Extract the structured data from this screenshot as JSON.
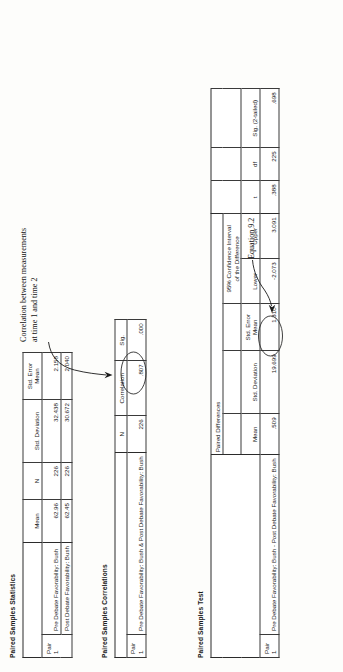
{
  "page": {
    "orientation": "rotated-90-ccw",
    "background": "#fdfdfb",
    "ink": "#1a1a1a"
  },
  "annotations": [
    {
      "id": "corr-note",
      "line1": "Correlation between measurements",
      "line2": "at time 1 and time 2",
      "points_to": ".807"
    },
    {
      "id": "equation-note",
      "text": "Equation 9.2",
      "points_to": "1.310"
    }
  ],
  "tables": [
    {
      "id": "paired-samples-statistics",
      "title": "Paired Samples Statistics",
      "columns": [
        "",
        "",
        "Mean",
        "N",
        "Std. Deviation",
        "Std. Error Mean"
      ],
      "pair_label": "Pair",
      "pair_number": "1",
      "rows": [
        {
          "label": "Pre Debate Favorability: Bush",
          "mean": "62.96",
          "n": "226",
          "std_deviation": "32.438",
          "std_error_mean": "2.158"
        },
        {
          "label": "Post Debate Favorability: Bush",
          "mean": "62.45",
          "n": "226",
          "std_deviation": "30.672",
          "std_error_mean": "2.040"
        }
      ]
    },
    {
      "id": "paired-samples-correlations",
      "title": "Paired Samples Correlations",
      "columns": [
        "",
        "",
        "N",
        "Correlation",
        "Sig."
      ],
      "pair_label": "Pair",
      "pair_number": "1",
      "rows": [
        {
          "label": "Pre Debate Favorability: Bush & Post Debate Favorability: Bush",
          "n": "226",
          "correlation": ".807",
          "sig": ".000",
          "highlighted_cell": "correlation"
        }
      ]
    },
    {
      "id": "paired-samples-test",
      "title": "Paired Samples Test",
      "group_header": "Paired Differences",
      "ci_header_line1": "95% Confidence Interval",
      "ci_header_line2": "of the Difference",
      "columns": [
        "",
        "",
        "Mean",
        "Std. Deviation",
        "Std. Error Mean",
        "Lower",
        "Upper",
        "t",
        "df",
        "Sig. (2-tailed)"
      ],
      "pair_label": "Pair",
      "pair_number": "1",
      "rows": [
        {
          "label": "Pre Debate Favorability: Bush - Post Debate Favorability: Bush",
          "mean": ".509",
          "std_deviation": "19.699",
          "std_error_mean": "1.310",
          "ci_lower": "-2.073",
          "ci_upper": "3.091",
          "t": ".388",
          "df": "225",
          "sig_2tailed": ".698",
          "highlighted_cell": "std_error_mean"
        }
      ]
    }
  ]
}
